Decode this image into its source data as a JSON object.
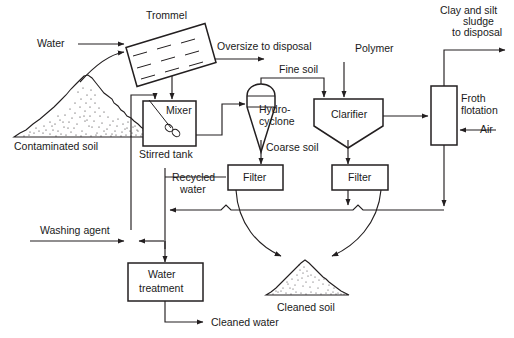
{
  "diagram": {
    "type": "process-flow",
    "background_color": "#ffffff",
    "line_color": "#231f20",
    "text_color": "#1a1a1a",
    "units": [
      {
        "id": "trommel",
        "label": "Trommel",
        "shape": "tilted-rectangle-screen"
      },
      {
        "id": "mixer",
        "label": "Mixer",
        "shape": "square-with-impeller"
      },
      {
        "id": "stirred-tank",
        "label": "Stirred tank",
        "shape": "caption"
      },
      {
        "id": "hydrocyclone",
        "label_line1": "Hydro-",
        "label_line2": "cyclone",
        "shape": "cyclone"
      },
      {
        "id": "clarifier",
        "label": "Clarifier",
        "shape": "pentagon-hopper"
      },
      {
        "id": "froth-flotation",
        "label_line1": "Froth",
        "label_line2": "flotation",
        "shape": "tall-rectangle"
      },
      {
        "id": "filter-coarse",
        "label": "Filter",
        "shape": "rectangle"
      },
      {
        "id": "filter-fine",
        "label": "Filter",
        "shape": "rectangle"
      },
      {
        "id": "water-treatment",
        "label_line1": "Water",
        "label_line2": "treatment",
        "shape": "rectangle"
      }
    ],
    "piles": [
      {
        "id": "contaminated-soil",
        "label": "Contaminated soil"
      },
      {
        "id": "cleaned-soil",
        "label": "Cleaned soil"
      }
    ],
    "streams": [
      {
        "id": "water-in",
        "label": "Water"
      },
      {
        "id": "oversize",
        "label": "Oversize to disposal"
      },
      {
        "id": "fine-soil",
        "label": "Fine soil"
      },
      {
        "id": "coarse-soil",
        "label": "Coarse soil"
      },
      {
        "id": "polymer-in",
        "label": "Polymer"
      },
      {
        "id": "air-in",
        "label": "Air"
      },
      {
        "id": "sludge-out",
        "label_line1": "Clay and silt",
        "label_line2": "sludge",
        "label_line3": "to disposal"
      },
      {
        "id": "recycled-water",
        "label_line1": "Recycled",
        "label_line2": "water"
      },
      {
        "id": "washing-agent",
        "label": "Washing agent"
      },
      {
        "id": "cleaned-water",
        "label": "Cleaned water"
      }
    ]
  }
}
